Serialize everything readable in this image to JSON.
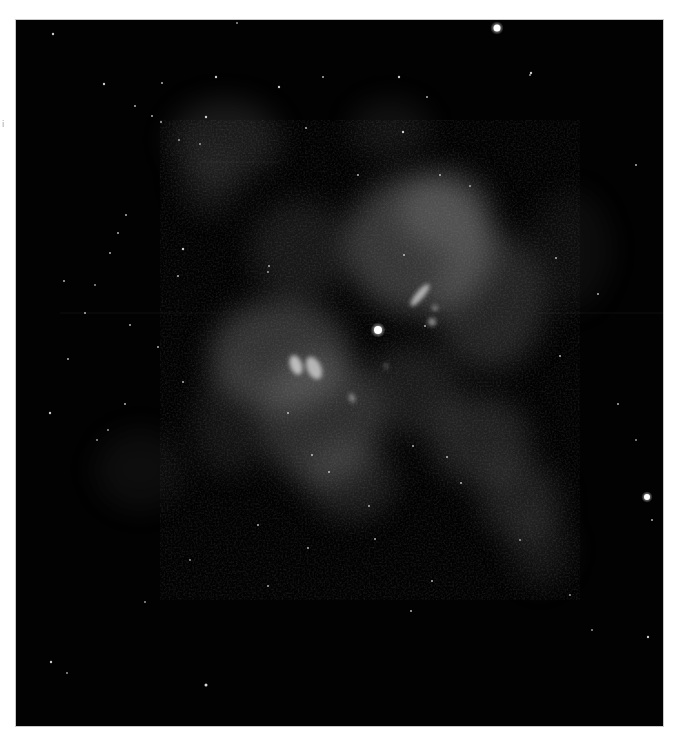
{
  "figure": {
    "colormap": "grayscale",
    "background_color": "#020202",
    "frame": {
      "left": 16,
      "top": 20,
      "width": 647,
      "height": 706
    },
    "side_mark": "i"
  },
  "nebula_clouds": [
    {
      "cx": 225,
      "cy": 140,
      "rx": 55,
      "ry": 40,
      "opacity": 0.16
    },
    {
      "cx": 210,
      "cy": 185,
      "rx": 30,
      "ry": 30,
      "opacity": 0.12
    },
    {
      "cx": 390,
      "cy": 130,
      "rx": 40,
      "ry": 30,
      "opacity": 0.1
    },
    {
      "cx": 420,
      "cy": 245,
      "rx": 75,
      "ry": 70,
      "opacity": 0.34
    },
    {
      "cx": 445,
      "cy": 210,
      "rx": 45,
      "ry": 40,
      "opacity": 0.28
    },
    {
      "cx": 490,
      "cy": 300,
      "rx": 55,
      "ry": 70,
      "opacity": 0.22
    },
    {
      "cx": 300,
      "cy": 250,
      "rx": 50,
      "ry": 50,
      "opacity": 0.14
    },
    {
      "cx": 280,
      "cy": 355,
      "rx": 70,
      "ry": 55,
      "opacity": 0.32
    },
    {
      "cx": 320,
      "cy": 420,
      "rx": 60,
      "ry": 65,
      "opacity": 0.28
    },
    {
      "cx": 350,
      "cy": 480,
      "rx": 45,
      "ry": 40,
      "opacity": 0.18
    },
    {
      "cx": 410,
      "cy": 390,
      "rx": 50,
      "ry": 45,
      "opacity": 0.16
    },
    {
      "cx": 480,
      "cy": 440,
      "rx": 50,
      "ry": 45,
      "opacity": 0.2
    },
    {
      "cx": 520,
      "cy": 500,
      "rx": 40,
      "ry": 40,
      "opacity": 0.18
    },
    {
      "cx": 540,
      "cy": 550,
      "rx": 30,
      "ry": 35,
      "opacity": 0.12
    },
    {
      "cx": 230,
      "cy": 420,
      "rx": 35,
      "ry": 55,
      "opacity": 0.12
    },
    {
      "cx": 140,
      "cy": 470,
      "rx": 45,
      "ry": 40,
      "opacity": 0.08
    },
    {
      "cx": 570,
      "cy": 250,
      "rx": 40,
      "ry": 60,
      "opacity": 0.08
    }
  ],
  "bright_knots": [
    {
      "cx": 296,
      "cy": 365,
      "rx": 6,
      "ry": 10,
      "rot": -20,
      "opacity": 0.75
    },
    {
      "cx": 314,
      "cy": 368,
      "rx": 7,
      "ry": 12,
      "rot": -25,
      "opacity": 0.7
    },
    {
      "cx": 420,
      "cy": 295,
      "rx": 4,
      "ry": 14,
      "rot": 40,
      "opacity": 0.7
    },
    {
      "cx": 432,
      "cy": 322,
      "rx": 4,
      "ry": 4,
      "rot": 0,
      "opacity": 0.55
    },
    {
      "cx": 435,
      "cy": 308,
      "rx": 3,
      "ry": 3,
      "rot": 0,
      "opacity": 0.45
    },
    {
      "cx": 352,
      "cy": 398,
      "rx": 3,
      "ry": 5,
      "rot": -20,
      "opacity": 0.45
    },
    {
      "cx": 386,
      "cy": 366,
      "rx": 2,
      "ry": 3,
      "rot": 0,
      "opacity": 0.35
    }
  ],
  "stars": [
    {
      "x": 497,
      "y": 28,
      "r": 3.5,
      "b": 1.0
    },
    {
      "x": 378,
      "y": 330,
      "r": 4,
      "b": 1.0
    },
    {
      "x": 647,
      "y": 497,
      "r": 3,
      "b": 1.0
    },
    {
      "x": 53,
      "y": 34,
      "r": 1.2,
      "b": 0.8
    },
    {
      "x": 237,
      "y": 23,
      "r": 1,
      "b": 0.6
    },
    {
      "x": 104,
      "y": 84,
      "r": 1.2,
      "b": 0.8
    },
    {
      "x": 162,
      "y": 83,
      "r": 1,
      "b": 0.7
    },
    {
      "x": 216,
      "y": 77,
      "r": 1.2,
      "b": 0.8
    },
    {
      "x": 279,
      "y": 87,
      "r": 1.2,
      "b": 0.8
    },
    {
      "x": 323,
      "y": 77,
      "r": 1,
      "b": 0.7
    },
    {
      "x": 399,
      "y": 77,
      "r": 1.2,
      "b": 0.8
    },
    {
      "x": 427,
      "y": 97,
      "r": 1,
      "b": 0.7
    },
    {
      "x": 531,
      "y": 73,
      "r": 1.2,
      "b": 0.8
    },
    {
      "x": 135,
      "y": 106,
      "r": 1,
      "b": 0.7
    },
    {
      "x": 152,
      "y": 116,
      "r": 1,
      "b": 0.7
    },
    {
      "x": 206,
      "y": 117,
      "r": 1.2,
      "b": 0.8
    },
    {
      "x": 306,
      "y": 128,
      "r": 1,
      "b": 0.7
    },
    {
      "x": 161,
      "y": 122,
      "r": 1,
      "b": 0.7
    },
    {
      "x": 179,
      "y": 140,
      "r": 1,
      "b": 0.6
    },
    {
      "x": 200,
      "y": 144,
      "r": 1,
      "b": 0.6
    },
    {
      "x": 403,
      "y": 132,
      "r": 1.2,
      "b": 0.8
    },
    {
      "x": 358,
      "y": 175,
      "r": 1,
      "b": 0.7
    },
    {
      "x": 440,
      "y": 175,
      "r": 1,
      "b": 0.7
    },
    {
      "x": 126,
      "y": 215,
      "r": 1,
      "b": 0.7
    },
    {
      "x": 118,
      "y": 233,
      "r": 1,
      "b": 0.7
    },
    {
      "x": 110,
      "y": 253,
      "r": 1,
      "b": 0.7
    },
    {
      "x": 64,
      "y": 281,
      "r": 1,
      "b": 0.7
    },
    {
      "x": 95,
      "y": 285,
      "r": 1,
      "b": 0.6
    },
    {
      "x": 183,
      "y": 249,
      "r": 1.2,
      "b": 0.8
    },
    {
      "x": 178,
      "y": 276,
      "r": 1,
      "b": 0.7
    },
    {
      "x": 85,
      "y": 313,
      "r": 1,
      "b": 0.7
    },
    {
      "x": 130,
      "y": 325,
      "r": 1,
      "b": 0.7
    },
    {
      "x": 158,
      "y": 347,
      "r": 1,
      "b": 0.7
    },
    {
      "x": 68,
      "y": 359,
      "r": 1,
      "b": 0.7
    },
    {
      "x": 183,
      "y": 382,
      "r": 1,
      "b": 0.7
    },
    {
      "x": 125,
      "y": 404,
      "r": 1,
      "b": 0.7
    },
    {
      "x": 50,
      "y": 413,
      "r": 1.2,
      "b": 0.8
    },
    {
      "x": 108,
      "y": 430,
      "r": 1,
      "b": 0.6
    },
    {
      "x": 97,
      "y": 440,
      "r": 1,
      "b": 0.6
    },
    {
      "x": 404,
      "y": 255,
      "r": 1,
      "b": 0.7
    },
    {
      "x": 269,
      "y": 266,
      "r": 1,
      "b": 0.7
    },
    {
      "x": 268,
      "y": 272,
      "r": 1,
      "b": 0.6
    },
    {
      "x": 425,
      "y": 326,
      "r": 1,
      "b": 0.7
    },
    {
      "x": 288,
      "y": 413,
      "r": 1,
      "b": 0.7
    },
    {
      "x": 312,
      "y": 455,
      "r": 1,
      "b": 0.7
    },
    {
      "x": 329,
      "y": 472,
      "r": 1,
      "b": 0.7
    },
    {
      "x": 258,
      "y": 525,
      "r": 1,
      "b": 0.7
    },
    {
      "x": 308,
      "y": 548,
      "r": 1,
      "b": 0.7
    },
    {
      "x": 369,
      "y": 506,
      "r": 1,
      "b": 0.7
    },
    {
      "x": 375,
      "y": 539,
      "r": 1,
      "b": 0.7
    },
    {
      "x": 413,
      "y": 446,
      "r": 1,
      "b": 0.7
    },
    {
      "x": 461,
      "y": 483,
      "r": 1,
      "b": 0.7
    },
    {
      "x": 447,
      "y": 457,
      "r": 1,
      "b": 0.7
    },
    {
      "x": 556,
      "y": 258,
      "r": 1,
      "b": 0.7
    },
    {
      "x": 598,
      "y": 294,
      "r": 1,
      "b": 0.7
    },
    {
      "x": 560,
      "y": 356,
      "r": 1,
      "b": 0.7
    },
    {
      "x": 618,
      "y": 404,
      "r": 1,
      "b": 0.7
    },
    {
      "x": 636,
      "y": 440,
      "r": 1,
      "b": 0.6
    },
    {
      "x": 652,
      "y": 520,
      "r": 1,
      "b": 0.7
    },
    {
      "x": 592,
      "y": 630,
      "r": 1,
      "b": 0.6
    },
    {
      "x": 648,
      "y": 637,
      "r": 1.2,
      "b": 0.8
    },
    {
      "x": 268,
      "y": 586,
      "r": 1,
      "b": 0.7
    },
    {
      "x": 432,
      "y": 581,
      "r": 1,
      "b": 0.7
    },
    {
      "x": 411,
      "y": 611,
      "r": 1,
      "b": 0.7
    },
    {
      "x": 51,
      "y": 662,
      "r": 1.2,
      "b": 0.8
    },
    {
      "x": 67,
      "y": 673,
      "r": 1,
      "b": 0.6
    },
    {
      "x": 206,
      "y": 685,
      "r": 1.5,
      "b": 0.85
    },
    {
      "x": 636,
      "y": 165,
      "r": 1,
      "b": 0.7
    },
    {
      "x": 530,
      "y": 75,
      "r": 1,
      "b": 0.6
    },
    {
      "x": 470,
      "y": 186,
      "r": 1,
      "b": 0.6
    },
    {
      "x": 145,
      "y": 602,
      "r": 1,
      "b": 0.6
    },
    {
      "x": 190,
      "y": 560,
      "r": 1,
      "b": 0.6
    },
    {
      "x": 570,
      "y": 595,
      "r": 1,
      "b": 0.6
    },
    {
      "x": 520,
      "y": 540,
      "r": 1,
      "b": 0.6
    }
  ]
}
